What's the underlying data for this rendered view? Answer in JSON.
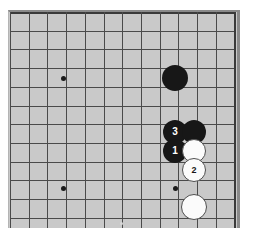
{
  "figure": {
    "board_color": "#c9c9c9",
    "line_color": "#4a4a4a",
    "edge_color": "#3a3a3a",
    "black_color": "#171717",
    "white_color": "#fbfbfb",
    "page_background": "#ffffff"
  },
  "board": {
    "left": 10,
    "top": 12,
    "cell": 18.7,
    "cols": 12,
    "rows": 11,
    "right_edge_index": 12,
    "top_edge_index": 0
  },
  "star_points": [
    {
      "name": "star-point-upper-left",
      "cx": 63,
      "cy": 78
    },
    {
      "name": "star-point-lower-left",
      "cx": 63,
      "cy": 188
    },
    {
      "name": "star-point-lower-right",
      "cx": 175,
      "cy": 188
    }
  ],
  "stones": [
    {
      "name": "black-stone-corner",
      "color": "black",
      "label": "",
      "cx": 175,
      "cy": 78,
      "r": 13
    },
    {
      "name": "black-stone-move-3",
      "color": "black",
      "label": "3",
      "cx": 175,
      "cy": 132,
      "r": 12
    },
    {
      "name": "black-stone-unnumbered-right",
      "color": "black",
      "label": "",
      "cx": 194,
      "cy": 132,
      "r": 12
    },
    {
      "name": "black-stone-move-1",
      "color": "black",
      "label": "1",
      "cx": 175,
      "cy": 151,
      "r": 12
    },
    {
      "name": "white-stone-unnumbered-upper",
      "color": "white",
      "label": "",
      "cx": 194,
      "cy": 151,
      "r": 12
    },
    {
      "name": "white-stone-move-2",
      "color": "white",
      "label": "2",
      "cx": 194,
      "cy": 170,
      "r": 12
    },
    {
      "name": "white-stone-unnumbered-lower",
      "color": "white",
      "label": "",
      "cx": 194,
      "cy": 207,
      "r": 13
    }
  ],
  "moves": [
    {
      "number": "1",
      "player": "Black"
    },
    {
      "number": "2",
      "player": "White"
    },
    {
      "number": "3",
      "player": "Black"
    }
  ]
}
